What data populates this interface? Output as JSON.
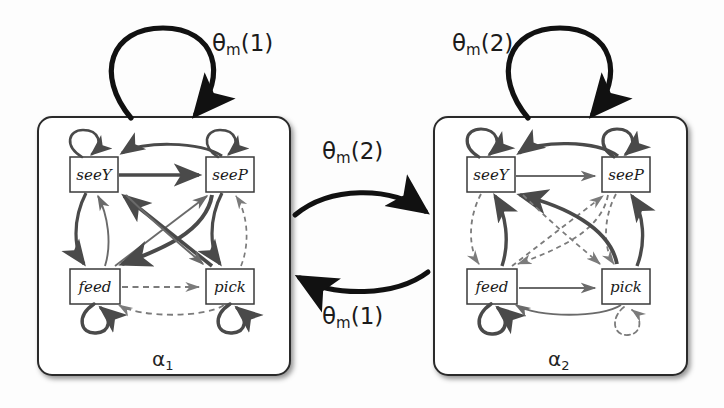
{
  "figure": {
    "type": "state-transition-diagram",
    "background_color": "#fdfdfd",
    "width": 724,
    "height": 408
  },
  "macro_states": [
    {
      "id": "alpha1",
      "label": "α",
      "subscript": "1",
      "label_x": 152,
      "label_y": 349,
      "panel": {
        "x": 38,
        "y": 117,
        "w": 252,
        "h": 258,
        "radius": 14,
        "stroke": "#2b2b2b",
        "fill": "#ffffff"
      },
      "nodes": [
        {
          "id": "seeY",
          "label": "seeY",
          "x": 70,
          "y": 157,
          "w": 48,
          "h": 35
        },
        {
          "id": "seeP",
          "label": "seeP",
          "x": 206,
          "y": 157,
          "w": 48,
          "h": 35
        },
        {
          "id": "feed",
          "label": "feed",
          "x": 70,
          "y": 269,
          "w": 50,
          "h": 35
        },
        {
          "id": "pick",
          "label": "pick",
          "x": 206,
          "y": 269,
          "w": 48,
          "h": 35
        }
      ],
      "self_loop_label": "θ",
      "self_loop_sub": "m",
      "self_loop_arg": "(1)",
      "self_loop_label_x": 212,
      "self_loop_label_y": 32
    },
    {
      "id": "alpha2",
      "label": "α",
      "subscript": "2",
      "label_x": 548,
      "label_y": 349,
      "panel": {
        "x": 434,
        "y": 117,
        "w": 253,
        "h": 258,
        "radius": 14,
        "stroke": "#2b2b2b",
        "fill": "#ffffff"
      },
      "nodes": [
        {
          "id": "seeY",
          "label": "seeY",
          "x": 467,
          "y": 157,
          "w": 48,
          "h": 35
        },
        {
          "id": "seeP",
          "label": "seeP",
          "x": 602,
          "y": 157,
          "w": 48,
          "h": 35
        },
        {
          "id": "feed",
          "label": "feed",
          "x": 467,
          "y": 269,
          "w": 50,
          "h": 35
        },
        {
          "id": "pick",
          "label": "pick",
          "x": 602,
          "y": 269,
          "w": 48,
          "h": 35
        }
      ],
      "self_loop_label": "θ",
      "self_loop_sub": "m",
      "self_loop_arg": "(2)",
      "self_loop_label_x": 452,
      "self_loop_label_y": 32
    }
  ],
  "inter_transitions": [
    {
      "id": "alpha1-to-alpha2",
      "from": "alpha1",
      "to": "alpha2",
      "label": "θ",
      "subscript": "m",
      "arg": "(2)",
      "label_x": 325,
      "label_y": 140,
      "direction": "left-to-right"
    },
    {
      "id": "alpha2-to-alpha1",
      "from": "alpha2",
      "to": "alpha1",
      "label": "θ",
      "subscript": "m",
      "arg": "(1)",
      "label_x": 325,
      "label_y": 305,
      "direction": "right-to-left"
    }
  ],
  "legend": {
    "solid_meaning": "high-probability transition",
    "dashed_meaning": "low-probability transition"
  }
}
